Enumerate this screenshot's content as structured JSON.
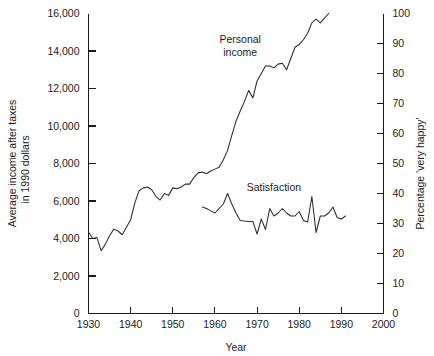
{
  "chart_data": {
    "type": "line",
    "title": "",
    "xlabel": "Year",
    "ylabel": "Average income after taxes in 1990 dollars",
    "ylabel_line1": "Average income after taxes",
    "ylabel_line2": "in 1990 dollars",
    "y2label": "Percentage 'very happy'",
    "xlim": [
      1930,
      2000
    ],
    "ylim": [
      0,
      16000
    ],
    "y2lim": [
      0,
      100
    ],
    "grid": false,
    "legend_position": "inline-annotations",
    "xticks": [
      1930,
      1940,
      1950,
      1960,
      1970,
      1980,
      1990,
      2000
    ],
    "xticklabels": [
      "1930",
      "1940",
      "1950",
      "1960",
      "1970",
      "1980",
      "1990",
      "2000"
    ],
    "yticks": [
      0,
      2000,
      4000,
      6000,
      8000,
      10000,
      12000,
      14000,
      16000
    ],
    "yticklabels": [
      "0",
      "2,000",
      "4,000",
      "6,000",
      "8,000",
      "10,000",
      "12,000",
      "14,000",
      "16,000"
    ],
    "y2ticks": [
      0,
      10,
      20,
      30,
      40,
      50,
      60,
      70,
      80,
      90,
      100
    ],
    "y2ticklabels": [
      "0",
      "10",
      "20",
      "30",
      "40",
      "50",
      "60",
      "70",
      "80",
      "90",
      "100"
    ],
    "annotations": [
      {
        "text_line1": "Personal",
        "text_line2": "income",
        "x": 1966,
        "y": 14450
      },
      {
        "text_line1": "Satisfaction",
        "text_line2": "",
        "x": 1974,
        "y": 6550
      }
    ],
    "series": [
      {
        "name": "Personal income",
        "axis": "left",
        "units": "1990 dollars",
        "x": [
          1930,
          1931,
          1932,
          1933,
          1934,
          1935,
          1936,
          1937,
          1938,
          1939,
          1940,
          1941,
          1942,
          1943,
          1944,
          1945,
          1946,
          1947,
          1948,
          1949,
          1950,
          1951,
          1952,
          1953,
          1954,
          1955,
          1956,
          1957,
          1958,
          1959,
          1960,
          1961,
          1962,
          1963,
          1964,
          1965,
          1966,
          1967,
          1968,
          1969,
          1970,
          1971,
          1972,
          1973,
          1974,
          1975,
          1976,
          1977,
          1978,
          1979,
          1980,
          1981,
          1982,
          1983,
          1984,
          1985,
          1986,
          1987
        ],
        "values": [
          4350,
          4000,
          4050,
          3350,
          3700,
          4150,
          4500,
          4400,
          4200,
          4600,
          5000,
          5900,
          6550,
          6700,
          6750,
          6600,
          6250,
          6050,
          6400,
          6300,
          6700,
          6650,
          6750,
          6900,
          6900,
          7250,
          7500,
          7550,
          7450,
          7600,
          7700,
          7800,
          8200,
          8700,
          9500,
          10250,
          10800,
          11300,
          11900,
          11500,
          12400,
          12800,
          13200,
          13200,
          13100,
          13300,
          13350,
          13000,
          13600,
          14200,
          14350,
          14600,
          14950,
          15500,
          15700,
          15500,
          15750,
          16000
        ]
      },
      {
        "name": "Satisfaction",
        "axis": "right",
        "units": "percentage 'very happy'",
        "x": [
          1957,
          1958,
          1959,
          1960,
          1961,
          1962,
          1963,
          1964,
          1965,
          1966,
          1967,
          1968,
          1969,
          1970,
          1971,
          1972,
          1973,
          1974,
          1975,
          1976,
          1977,
          1978,
          1979,
          1980,
          1981,
          1982,
          1983,
          1984,
          1985,
          1986,
          1987,
          1988,
          1989,
          1990,
          1991
        ],
        "values": [
          35.5,
          35.0,
          34.2,
          33.5,
          35.0,
          36.5,
          40.0,
          36.5,
          33.5,
          31.0,
          30.8,
          30.7,
          30.7,
          26.5,
          31.5,
          28.0,
          35.0,
          32.5,
          33.5,
          35.0,
          33.5,
          32.5,
          32.5,
          34.0,
          31.0,
          30.5,
          39.0,
          27.0,
          32.5,
          32.5,
          33.5,
          35.5,
          32.0,
          31.5,
          32.5
        ]
      }
    ]
  }
}
